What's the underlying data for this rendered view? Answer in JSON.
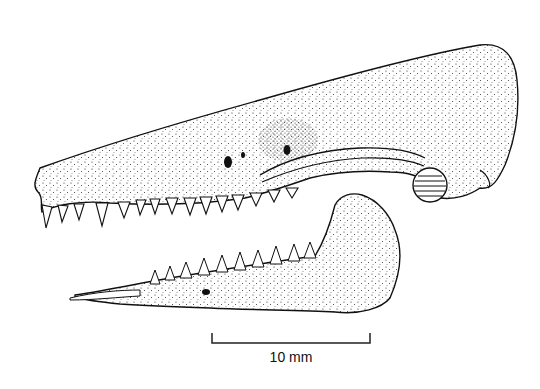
{
  "figure": {
    "scale_bar": {
      "label": "10 mm"
    }
  }
}
